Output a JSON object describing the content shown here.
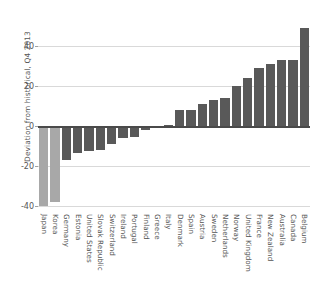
{
  "chart_data": {
    "type": "bar",
    "title": "",
    "subtitle": "",
    "xlabel": "",
    "ylabel": "Deviation from historical, Q4 2013",
    "ylim": [
      -42,
      52
    ],
    "yticks": [
      40,
      20,
      0,
      -20,
      -40
    ],
    "ytick_labels": [
      "40",
      "20",
      "0",
      "-20",
      "-40"
    ],
    "grid": true,
    "legend": false,
    "orientation": "vertical",
    "categories": [
      "Japan",
      "Korea",
      "Germany",
      "Estonia",
      "United States",
      "Slovak Republic",
      "Switzerland",
      "Ireland",
      "Portugal",
      "Finland",
      "Greece",
      "Italy",
      "Denmark",
      "Spain",
      "Austria",
      "Sweden",
      "Netherlands",
      "Norway",
      "United Kingdom",
      "France",
      "New Zealand",
      "Australia",
      "Canada",
      "Belgium"
    ],
    "values": [
      -40,
      -38,
      -17,
      -13.5,
      -12.5,
      -12,
      -9,
      -6,
      -5.5,
      -2,
      -1,
      0.5,
      8,
      8,
      11,
      13,
      14,
      20,
      24,
      29,
      31,
      33,
      33,
      49
    ],
    "bar_colors": [
      "#a8a8a8",
      "#a8a8a8",
      "#595959",
      "#595959",
      "#595959",
      "#595959",
      "#595959",
      "#595959",
      "#595959",
      "#595959",
      "#595959",
      "#595959",
      "#595959",
      "#595959",
      "#595959",
      "#595959",
      "#595959",
      "#595959",
      "#595959",
      "#595959",
      "#595959",
      "#595959",
      "#595959",
      "#595959"
    ],
    "colors": {
      "bar_dark": "#595959",
      "bar_light": "#a8a8a8",
      "gridline": "#d9d9d9",
      "zero_axis": "#4a4a4a",
      "text": "#555555",
      "background": "#ffffff"
    }
  }
}
